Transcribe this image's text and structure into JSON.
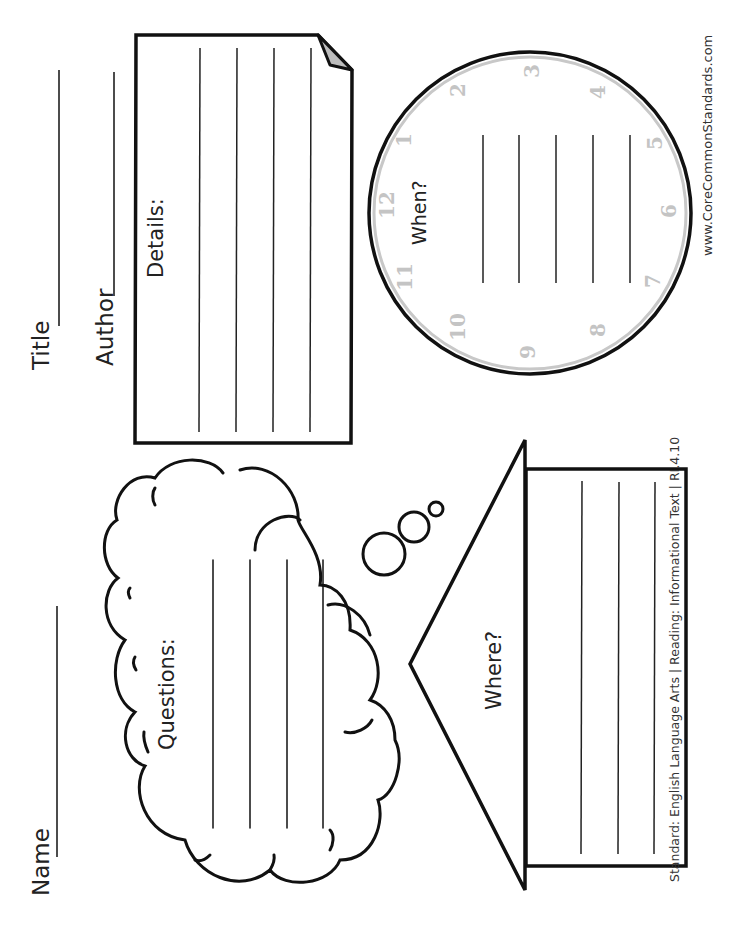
{
  "worksheet": {
    "orientation": "rotated-90-ccw",
    "header": {
      "name_label": "Name",
      "title_label": "Title",
      "author_label": "Author"
    },
    "details_card": {
      "label": "Details:",
      "writing_lines": 4
    },
    "questions_cloud": {
      "label": "Questions:",
      "writing_lines": 4
    },
    "where_house": {
      "label": "Where?",
      "writing_lines": 3
    },
    "when_clock": {
      "label": "When?",
      "writing_lines": 5,
      "numbers": [
        "12",
        "1",
        "2",
        "3",
        "4",
        "5",
        "6",
        "7",
        "8",
        "9",
        "10",
        "11"
      ]
    },
    "footer": {
      "website": "www.CoreCommonStandards.com",
      "standard": "Standard: English Language Arts |  Reading: Informational Text |  RI.4.10"
    },
    "colors": {
      "ink": "#111111",
      "clock_ring": "#c8c8c8",
      "page_fold": "#bdbdbd"
    }
  }
}
